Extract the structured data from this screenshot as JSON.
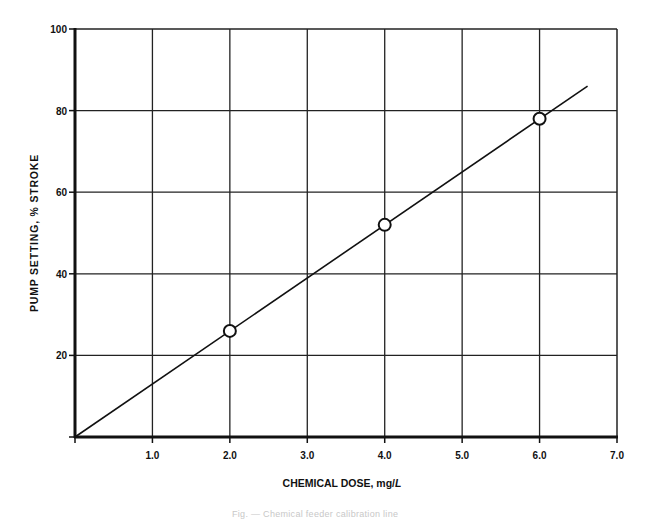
{
  "chart_data": {
    "type": "line",
    "title": "",
    "xlabel": "CHEMICAL DOSE, mg/L",
    "xlabel_main": "CHEMICAL DOSE, mg/",
    "xlabel_unit_italic": "L",
    "ylabel": "PUMP SETTING, % STROKE",
    "xlim": [
      0,
      7.0
    ],
    "ylim": [
      0,
      100
    ],
    "x_ticks": [
      "1.0",
      "2.0",
      "3.0",
      "4.0",
      "5.0",
      "6.0",
      "7.0"
    ],
    "y_ticks": [
      "20",
      "40",
      "60",
      "80",
      "100"
    ],
    "grid": true,
    "legend": null,
    "series": [
      {
        "name": "calibration points",
        "marker": "open-circle",
        "x": [
          2.0,
          4.0,
          6.0
        ],
        "y": [
          26,
          52,
          78
        ]
      },
      {
        "name": "calibration line",
        "marker": "none",
        "x": [
          0,
          6.62
        ],
        "y": [
          0,
          86
        ]
      }
    ]
  },
  "caption": "Fig. — Chemical feeder calibration line"
}
